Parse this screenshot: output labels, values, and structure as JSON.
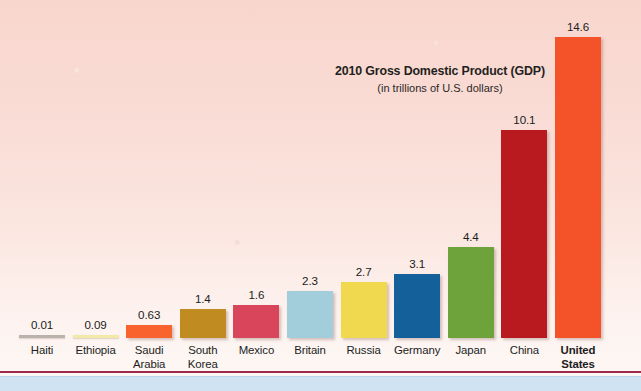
{
  "chart_data": {
    "type": "bar",
    "title": "2010 Gross Domestic Product (GDP)",
    "subtitle": "(in trillions of U.S. dollars)",
    "xlabel": "",
    "ylabel": "",
    "unit": "trillions of U.S. dollars",
    "ylim": [
      0,
      14.6
    ],
    "grid": false,
    "legend": "none",
    "axis_line": false,
    "value_labels_shown": true,
    "categories": [
      "Haiti",
      "Ethiopia",
      "Saudi Arabia",
      "South Korea",
      "Mexico",
      "Britain",
      "Russia",
      "Germany",
      "Japan",
      "China",
      "United States"
    ],
    "values": [
      0.01,
      0.09,
      0.63,
      1.4,
      1.6,
      2.3,
      2.7,
      3.1,
      4.4,
      10.1,
      14.6
    ],
    "value_labels": [
      "0.01",
      "0.09",
      "0.63",
      "1.4",
      "1.6",
      "2.3",
      "2.7",
      "3.1",
      "4.4",
      "10.1",
      "14.6"
    ],
    "bars": [
      {
        "label": "Haiti",
        "label_line1": "Haiti",
        "label_line2": "",
        "value": 0.01,
        "value_label": "0.01",
        "color": "#b9b2ad",
        "highlight": false
      },
      {
        "label": "Ethiopia",
        "label_line1": "Ethiopia",
        "label_line2": "",
        "value": 0.09,
        "value_label": "0.09",
        "color": "#f2e9a8",
        "highlight": false
      },
      {
        "label": "Saudi Arabia",
        "label_line1": "Saudi",
        "label_line2": "Arabia",
        "value": 0.63,
        "value_label": "0.63",
        "color": "#f8632e",
        "highlight": false
      },
      {
        "label": "South Korea",
        "label_line1": "South",
        "label_line2": "Korea",
        "value": 1.4,
        "value_label": "1.4",
        "color": "#c08b20",
        "highlight": false
      },
      {
        "label": "Mexico",
        "label_line1": "Mexico",
        "label_line2": "",
        "value": 1.6,
        "value_label": "1.6",
        "color": "#d9455a",
        "highlight": false
      },
      {
        "label": "Britain",
        "label_line1": "Britain",
        "label_line2": "",
        "value": 2.3,
        "value_label": "2.3",
        "color": "#a2cddb",
        "highlight": false
      },
      {
        "label": "Russia",
        "label_line1": "Russia",
        "label_line2": "",
        "value": 2.7,
        "value_label": "2.7",
        "color": "#f0d84f",
        "highlight": false
      },
      {
        "label": "Germany",
        "label_line1": "Germany",
        "label_line2": "",
        "value": 3.1,
        "value_label": "3.1",
        "color": "#14609b",
        "highlight": false
      },
      {
        "label": "Japan",
        "label_line1": "Japan",
        "label_line2": "",
        "value": 4.4,
        "value_label": "4.4",
        "color": "#6ea33c",
        "highlight": false
      },
      {
        "label": "China",
        "label_line1": "China",
        "label_line2": "",
        "value": 10.1,
        "value_label": "10.1",
        "color": "#b81a20",
        "highlight": false
      },
      {
        "label": "United States",
        "label_line1": "United",
        "label_line2": "States",
        "value": 14.6,
        "value_label": "14.6",
        "color": "#f45229",
        "highlight": true
      }
    ]
  },
  "style": {
    "background_top": "#f8d6ce",
    "background_bottom": "#fdf6f3",
    "rule_color": "#9e2a4e",
    "footer_strip_color": "#cfe3f2",
    "text_color": "#211d1c"
  }
}
